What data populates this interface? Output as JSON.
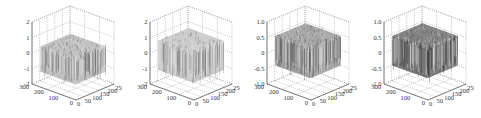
{
  "chart_data": [
    {
      "type": "surface3d",
      "title": "",
      "zlim": [
        -2,
        2
      ],
      "zticks": [
        "2",
        "1",
        "0",
        "-1",
        "-2"
      ],
      "xlim": [
        0,
        250
      ],
      "xticks": [
        "0",
        "50",
        "100",
        "150",
        "200",
        "250"
      ],
      "ylim": [
        0,
        300
      ],
      "yticks": [
        "0",
        "100",
        "200",
        "300"
      ],
      "grid": true,
      "surface_level": 0,
      "surface_amplitude": 1.2,
      "shade": "light-gray"
    },
    {
      "type": "surface3d",
      "title": "",
      "zlim": [
        -2,
        2
      ],
      "zticks": [
        "2",
        "1",
        "0",
        "-1",
        "-2"
      ],
      "xlim": [
        0,
        250
      ],
      "xticks": [
        "0",
        "50",
        "100",
        "150",
        "200",
        "250"
      ],
      "ylim": [
        0,
        300
      ],
      "yticks": [
        "0",
        "100",
        "200",
        "300"
      ],
      "grid": true,
      "surface_level": 0.3,
      "surface_amplitude": 1.4,
      "shade": "light-gray"
    },
    {
      "type": "surface3d",
      "title": "",
      "zlim": [
        -1.0,
        1.0
      ],
      "zticks": [
        "1.0",
        "0.5",
        "0",
        "-0.5",
        "-1.0"
      ],
      "xlim": [
        0,
        250
      ],
      "xticks": [
        "0",
        "50",
        "100",
        "150",
        "200",
        "250"
      ],
      "ylim": [
        0,
        300
      ],
      "yticks": [
        "0",
        "100",
        "200",
        "300"
      ],
      "grid": true,
      "surface_level": 0.3,
      "surface_amplitude": 0.7,
      "shade": "medium-gray"
    },
    {
      "type": "surface3d",
      "title": "",
      "zlim": [
        -1.0,
        1.0
      ],
      "zticks": [
        "1.0",
        "0.5",
        "0",
        "-0.5",
        "-1.0"
      ],
      "xlim": [
        0,
        250
      ],
      "xticks": [
        "0",
        "50",
        "100",
        "150",
        "200",
        "250"
      ],
      "ylim": [
        0,
        300
      ],
      "yticks": [
        "0",
        "100",
        "200",
        "300"
      ],
      "grid": true,
      "surface_level": 0.3,
      "surface_amplitude": 0.7,
      "shade": "dark-gray"
    }
  ],
  "panels": [
    {
      "left": 14,
      "shade": "#b8b8b8",
      "edge": "#555"
    },
    {
      "left": 131,
      "shade": "#c4c4c4",
      "edge": "#666"
    },
    {
      "left": 248,
      "shade": "#9a9a9a",
      "edge": "#444"
    },
    {
      "left": 365,
      "shade": "#6e6e6e",
      "edge": "#2a2a2a"
    }
  ]
}
